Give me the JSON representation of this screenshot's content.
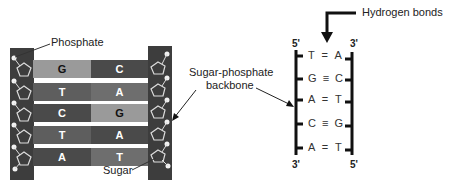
{
  "colors": {
    "backbone": "#3d3d3d",
    "light_base": "#9a9a9a",
    "dark_base": "#4a4a4a",
    "mid_base": "#6a6a6a",
    "gap": "#ffffff"
  },
  "left_diagram": {
    "labels": {
      "phosphate": "Phosphate",
      "sugar": "Sugar",
      "backbone_line1": "Sugar-phosphate",
      "backbone_line2": "backbone"
    },
    "pairs": [
      {
        "left": "G",
        "right": "C"
      },
      {
        "left": "T",
        "right": "A"
      },
      {
        "left": "C",
        "right": "G"
      },
      {
        "left": "T",
        "right": "A"
      },
      {
        "left": "A",
        "right": "T"
      }
    ]
  },
  "right_diagram": {
    "hydrogen_bonds_label": "Hydrogen bonds",
    "left_top": "5'",
    "right_top": "3'",
    "left_bottom": "3'",
    "right_bottom": "5'",
    "pairs": [
      {
        "left": "T",
        "bond": "=",
        "right": "A"
      },
      {
        "left": "G",
        "bond": "≡",
        "right": "C"
      },
      {
        "left": "A",
        "bond": "=",
        "right": "T"
      },
      {
        "left": "C",
        "bond": "≡",
        "right": "G"
      },
      {
        "left": "A",
        "bond": "=",
        "right": "T"
      }
    ]
  }
}
